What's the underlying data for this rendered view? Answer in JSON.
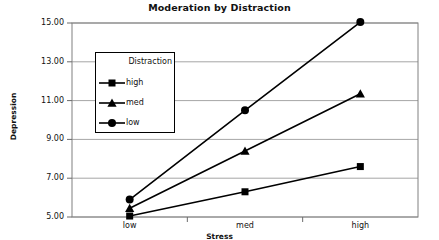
{
  "chart_data": {
    "type": "line",
    "title": "Moderation by Distraction",
    "xlabel": "Stress",
    "ylabel": "Depression",
    "categories": [
      "low",
      "med",
      "high"
    ],
    "series": [
      {
        "name": "high",
        "marker": "square",
        "values": [
          5.05,
          6.3,
          7.6
        ]
      },
      {
        "name": "med",
        "marker": "triangle",
        "values": [
          5.45,
          8.4,
          11.35
        ]
      },
      {
        "name": "low",
        "marker": "circle",
        "values": [
          5.9,
          10.5,
          15.05
        ]
      }
    ],
    "ylim": [
      5.0,
      15.0
    ],
    "yticks": [
      "5.00",
      "7.00",
      "9.00",
      "11.00",
      "13.00",
      "15.00"
    ],
    "ytick_values": [
      5,
      7,
      9,
      11,
      13,
      15
    ],
    "grid": true,
    "legend": {
      "title": "Distraction",
      "position": "inside-upper-left",
      "entries": [
        "high",
        "med",
        "low"
      ]
    },
    "colors": {
      "line": "#000000",
      "grid": "#a6a6a6",
      "frame": "#808080",
      "background": "#ffffff"
    }
  }
}
